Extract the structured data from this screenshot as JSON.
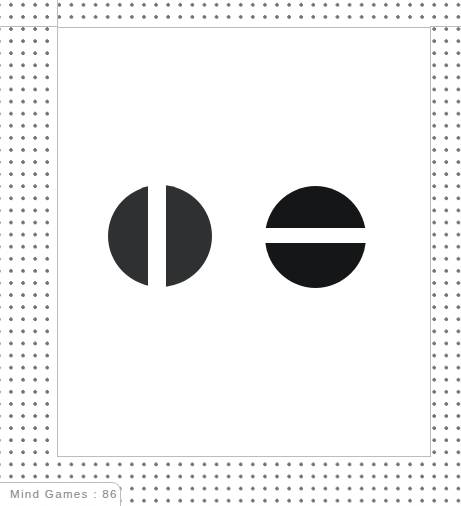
{
  "caption": {
    "label": "Mind Games : 86",
    "title": "Mind Games",
    "number": "86",
    "separator": ":"
  },
  "figure": {
    "title": "",
    "background_color": "#ffffff",
    "grid_dot_color": "#6f7378",
    "panel_border_color": "#b9bcc0",
    "caption_text_color": "#808488",
    "shapes": [
      {
        "name": "circle-split-vertical",
        "description": "Solid circle divided by a vertical white gap into a wide left half and a narrower right crescent",
        "fill_color": "#2e3032",
        "center_x": 160,
        "center_y": 236,
        "diameter": 103,
        "split_orientation": "vertical",
        "gap_width": 18,
        "gap_offset_from_center": -10
      },
      {
        "name": "circle-split-horizontal",
        "description": "Solid circle divided by a horizontal white gap into a top cap and a bottom cap",
        "fill_color": "#141617",
        "center_x": 315,
        "center_y": 237,
        "diameter": 101,
        "split_orientation": "horizontal",
        "gap_width": 15,
        "gap_offset_from_center": -8
      }
    ]
  }
}
